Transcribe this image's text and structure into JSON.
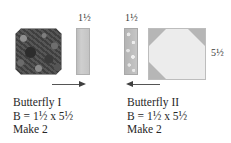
{
  "diagram": {
    "type": "quilt-block-cutting-diagram",
    "units": [
      {
        "id": "butterfly-1",
        "name": "Butterfly I",
        "formula": "B = 1½ x 5½",
        "make": "Make 2",
        "arrow_direction": "right",
        "pieces": [
          {
            "id": "dark-octagon-square",
            "fabric": "dark floral print",
            "shape": "octagon-cut square",
            "label": "",
            "color": "#4b4b4b"
          },
          {
            "id": "plain-strip",
            "fabric": "light grey solid",
            "shape": "narrow vertical strip",
            "label": "1½",
            "color": "#c4c4c4"
          }
        ]
      },
      {
        "id": "butterfly-2",
        "name": "Butterfly II",
        "formula": "B = 1½ x 5½",
        "make": "Make 2",
        "arrow_direction": "left",
        "pieces": [
          {
            "id": "speckled-strip",
            "fabric": "speckled grey print",
            "shape": "narrow vertical strip",
            "label": "1½",
            "color": "#b9b9b9"
          },
          {
            "id": "snowball-square",
            "fabric": "light solid with grey corners",
            "shape": "snowball square",
            "label": "5½",
            "corners": [
              "top-left",
              "top-right",
              "bottom-left"
            ],
            "color": "#ececec",
            "corner_color": "#b6b6b6"
          }
        ]
      }
    ]
  },
  "labels": {
    "strip_left_dim": "1½",
    "strip_right_dim": "1½",
    "snowball_dim": "5½"
  },
  "captions": {
    "left": {
      "title": "Butterfly I",
      "formula": "B = 1½ x 5½",
      "make": "Make 2"
    },
    "right": {
      "title": "Butterfly II",
      "formula": "B = 1½ x 5½",
      "make": "Make 2"
    }
  },
  "colors": {
    "dark_print": "#4b4b4b",
    "plain_strip": "#c4c4c4",
    "speckled_strip": "#b9b9b9",
    "snowball_center": "#ececec",
    "snowball_corner": "#b6b6b6",
    "text": "#272727",
    "arrow": "#3f3f3f",
    "background": "#ffffff"
  }
}
